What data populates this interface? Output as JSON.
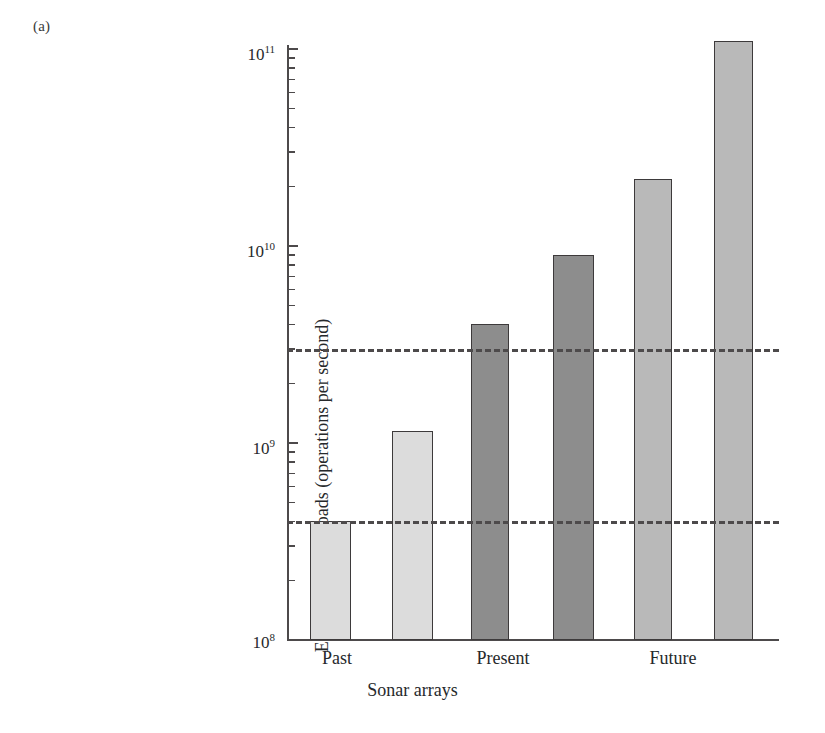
{
  "figure": {
    "panel_label": "(a)"
  },
  "chart_data": {
    "type": "bar",
    "title": "",
    "xlabel": "Sonar arrays",
    "ylabel": "Electronic sonar loads (operations per second)",
    "yscale": "log",
    "ylim": [
      100000000,
      200000000000
    ],
    "grid": false,
    "legend": null,
    "group_labels": [
      "Past",
      "Present",
      "Future"
    ],
    "categories": [
      "Past-1",
      "Past-2",
      "Present-1",
      "Present-2",
      "Future-1",
      "Future-2"
    ],
    "values": [
      400000000.0,
      1150000000.0,
      4000000000.0,
      9000000000.0,
      22000000000.0,
      110000000000.0
    ],
    "bar_shades": [
      "light",
      "light",
      "dark",
      "dark",
      "mid",
      "mid"
    ],
    "y_ticklabels": [
      "10",
      "10",
      "10",
      "10"
    ],
    "y_tickexponents": [
      "11",
      "10",
      "9",
      "8"
    ],
    "y_tickvalues": [
      100000000000.0,
      10000000000.0,
      1000000000.0,
      100000000.0
    ],
    "reference_lines": [
      {
        "value": 3000000000.0,
        "style": "dashed"
      },
      {
        "value": 400000000.0,
        "style": "dashed"
      }
    ],
    "colors": {
      "light": "#dcdcdc",
      "mid": "#b9b9b9",
      "dark": "#8d8d8d",
      "outline": "#3d3a3b",
      "axis": "#4d4a4b",
      "text": "#26292b"
    }
  }
}
